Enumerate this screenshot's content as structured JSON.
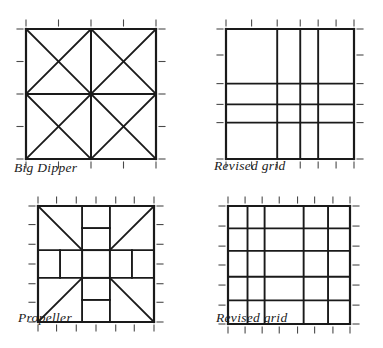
{
  "page": {
    "background_color": "#ffffff",
    "ink_color": "#1a1a1a",
    "tick_color": "#4a4a4a"
  },
  "figures": [
    {
      "id": "big-dipper",
      "caption": "Big Dipper",
      "type": "block-pattern",
      "box": {
        "x": 0,
        "y": 0,
        "width": 130,
        "height": 130
      },
      "ticks": {
        "x": [
          0,
          25,
          50,
          75,
          100
        ],
        "y": [
          0,
          25,
          50,
          75,
          100
        ]
      },
      "description": "Square divided by a center cross into four quadrants, each quadrant crossed by both of its diagonals",
      "lines_pct": [
        {
          "x1": 0,
          "y1": 0,
          "x2": 100,
          "y2": 0,
          "w": 2.2
        },
        {
          "x1": 100,
          "y1": 0,
          "x2": 100,
          "y2": 100,
          "w": 2.2
        },
        {
          "x1": 100,
          "y1": 100,
          "x2": 0,
          "y2": 100,
          "w": 2.2
        },
        {
          "x1": 0,
          "y1": 100,
          "x2": 0,
          "y2": 0,
          "w": 2.2
        },
        {
          "x1": 0,
          "y1": 50,
          "x2": 100,
          "y2": 50,
          "w": 2.0
        },
        {
          "x1": 50,
          "y1": 0,
          "x2": 50,
          "y2": 100,
          "w": 2.0
        },
        {
          "x1": 0,
          "y1": 0,
          "x2": 50,
          "y2": 50,
          "w": 1.8
        },
        {
          "x1": 50,
          "y1": 0,
          "x2": 0,
          "y2": 50,
          "w": 1.8
        },
        {
          "x1": 50,
          "y1": 0,
          "x2": 100,
          "y2": 50,
          "w": 1.8
        },
        {
          "x1": 100,
          "y1": 0,
          "x2": 50,
          "y2": 50,
          "w": 1.8
        },
        {
          "x1": 0,
          "y1": 50,
          "x2": 50,
          "y2": 100,
          "w": 1.8
        },
        {
          "x1": 50,
          "y1": 50,
          "x2": 0,
          "y2": 100,
          "w": 1.8
        },
        {
          "x1": 50,
          "y1": 50,
          "x2": 100,
          "y2": 100,
          "w": 1.8
        },
        {
          "x1": 100,
          "y1": 50,
          "x2": 50,
          "y2": 100,
          "w": 1.8
        }
      ]
    },
    {
      "id": "revised-grid-1",
      "caption": "Revised grid",
      "type": "revised-grid",
      "box": {
        "x": 0,
        "y": 0,
        "width": 128,
        "height": 130
      },
      "ticks": {
        "x": [
          0,
          20,
          40,
          58,
          72,
          86,
          100
        ],
        "y": [
          0,
          20,
          42,
          58,
          72,
          100
        ]
      },
      "description": "Irregular four by four grid with unequal column and row spacing",
      "verticals_pct": [
        0,
        40,
        58,
        72,
        100
      ],
      "horizontals_pct": [
        0,
        42,
        58,
        72,
        100
      ],
      "stroke_outer": 2.2,
      "stroke_inner": 1.9
    },
    {
      "id": "propeller",
      "caption": "Propeller",
      "type": "block-pattern",
      "box": {
        "x": 0,
        "y": 0,
        "width": 116,
        "height": 116
      },
      "ticks": {
        "x": [
          0,
          16,
          33,
          50,
          67,
          83,
          100
        ],
        "y": [
          0,
          16,
          33,
          50,
          67,
          83,
          100
        ]
      },
      "description": "Pinwheel block: central square with four corner diagonals, rectangular bars on each side and stepped blocks top and bottom",
      "lines_pct": [
        {
          "x1": 0,
          "y1": 0,
          "x2": 100,
          "y2": 0,
          "w": 2.2
        },
        {
          "x1": 100,
          "y1": 0,
          "x2": 100,
          "y2": 100,
          "w": 2.2
        },
        {
          "x1": 100,
          "y1": 100,
          "x2": 0,
          "y2": 100,
          "w": 2.2
        },
        {
          "x1": 0,
          "y1": 100,
          "x2": 0,
          "y2": 0,
          "w": 2.2
        },
        {
          "x1": 38,
          "y1": 38,
          "x2": 62,
          "y2": 38,
          "w": 2.0
        },
        {
          "x1": 62,
          "y1": 38,
          "x2": 62,
          "y2": 62,
          "w": 2.0
        },
        {
          "x1": 62,
          "y1": 62,
          "x2": 38,
          "y2": 62,
          "w": 2.0
        },
        {
          "x1": 38,
          "y1": 62,
          "x2": 38,
          "y2": 38,
          "w": 2.0
        },
        {
          "x1": 0,
          "y1": 0,
          "x2": 38,
          "y2": 38,
          "w": 1.8
        },
        {
          "x1": 100,
          "y1": 0,
          "x2": 62,
          "y2": 38,
          "w": 1.8
        },
        {
          "x1": 0,
          "y1": 100,
          "x2": 38,
          "y2": 62,
          "w": 1.8
        },
        {
          "x1": 100,
          "y1": 100,
          "x2": 62,
          "y2": 62,
          "w": 1.8
        },
        {
          "x1": 38,
          "y1": 0,
          "x2": 38,
          "y2": 38,
          "w": 1.9
        },
        {
          "x1": 62,
          "y1": 0,
          "x2": 62,
          "y2": 38,
          "w": 1.9
        },
        {
          "x1": 38,
          "y1": 19,
          "x2": 62,
          "y2": 19,
          "w": 1.9
        },
        {
          "x1": 38,
          "y1": 62,
          "x2": 38,
          "y2": 100,
          "w": 1.9
        },
        {
          "x1": 62,
          "y1": 62,
          "x2": 62,
          "y2": 100,
          "w": 1.9
        },
        {
          "x1": 38,
          "y1": 81,
          "x2": 62,
          "y2": 81,
          "w": 1.9
        },
        {
          "x1": 0,
          "y1": 38,
          "x2": 38,
          "y2": 38,
          "w": 1.9
        },
        {
          "x1": 0,
          "y1": 62,
          "x2": 38,
          "y2": 62,
          "w": 1.9
        },
        {
          "x1": 19,
          "y1": 38,
          "x2": 19,
          "y2": 62,
          "w": 1.9
        },
        {
          "x1": 62,
          "y1": 38,
          "x2": 100,
          "y2": 38,
          "w": 1.9
        },
        {
          "x1": 62,
          "y1": 62,
          "x2": 100,
          "y2": 62,
          "w": 1.9
        },
        {
          "x1": 81,
          "y1": 38,
          "x2": 81,
          "y2": 62,
          "w": 1.9
        }
      ]
    },
    {
      "id": "revised-grid-2",
      "caption": "Revised grid",
      "type": "revised-grid",
      "box": {
        "x": 0,
        "y": 0,
        "width": 122,
        "height": 118
      },
      "ticks": {
        "x": [
          0,
          14,
          28,
          42,
          57,
          71,
          86,
          100
        ],
        "y": [
          0,
          17,
          34,
          50,
          67,
          84,
          100
        ]
      },
      "description": "Irregular five by five grid with unequal column and row spacing",
      "verticals_pct": [
        0,
        16,
        30,
        62,
        82,
        100
      ],
      "horizontals_pct": [
        0,
        19,
        38,
        60,
        80,
        100
      ],
      "stroke_outer": 2.2,
      "stroke_inner": 1.9
    }
  ]
}
